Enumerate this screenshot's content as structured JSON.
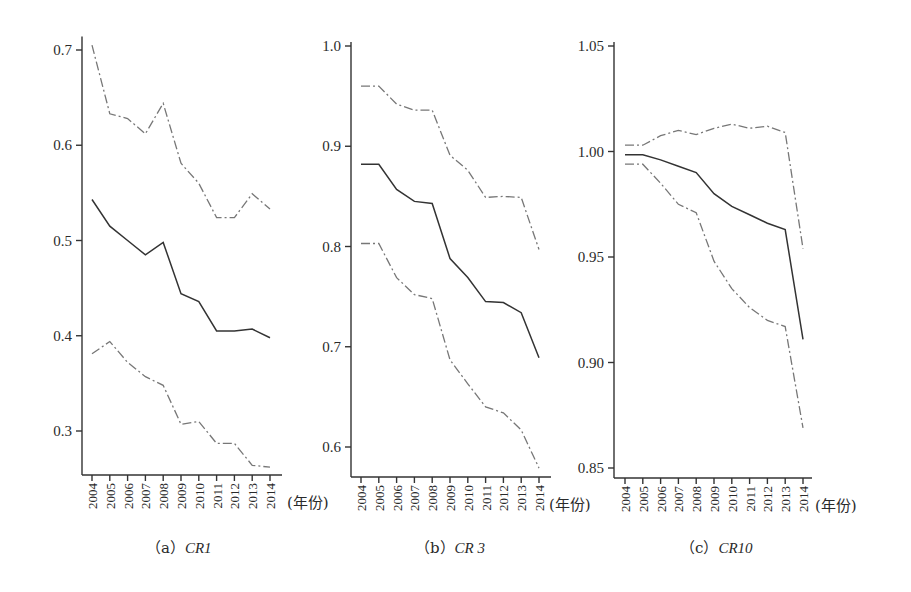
{
  "chart_data": [
    {
      "type": "line",
      "panel": "a",
      "caption_prefix": "（a）",
      "caption_metric": "CR1",
      "x": [
        "2004",
        "2005",
        "2006",
        "2007",
        "2008",
        "2009",
        "2010",
        "2011",
        "2012",
        "2013",
        "2014"
      ],
      "x_unit_label": "(年份)",
      "ylim": [
        0.255,
        0.71
      ],
      "yticks": [
        0.3,
        0.4,
        0.5,
        0.6,
        0.7
      ],
      "ytick_labels": [
        "0.3",
        "0.4",
        "0.5",
        "0.6",
        "0.7"
      ],
      "series": [
        {
          "name": "upper",
          "style": "dash-dot",
          "values": [
            0.705,
            0.633,
            0.628,
            0.612,
            0.644,
            0.581,
            0.56,
            0.524,
            0.524,
            0.549,
            0.533
          ]
        },
        {
          "name": "estimate",
          "style": "solid",
          "values": [
            0.543,
            0.515,
            0.5,
            0.485,
            0.498,
            0.444,
            0.436,
            0.405,
            0.405,
            0.407,
            0.398
          ]
        },
        {
          "name": "lower",
          "style": "dash-dot",
          "values": [
            0.381,
            0.394,
            0.372,
            0.357,
            0.348,
            0.307,
            0.31,
            0.287,
            0.287,
            0.264,
            0.262
          ]
        }
      ]
    },
    {
      "type": "line",
      "panel": "b",
      "caption_prefix": "（b）",
      "caption_metric": "CR 3",
      "x": [
        "2004",
        "2005",
        "2006",
        "2007",
        "2008",
        "2009",
        "2010",
        "2011",
        "2012",
        "2013",
        "2014"
      ],
      "x_unit_label": "(年份)",
      "ylim": [
        0.57,
        1.0
      ],
      "yticks": [
        0.6,
        0.7,
        0.8,
        0.9,
        1.0
      ],
      "ytick_labels": [
        "0.6",
        "0.7",
        "0.8",
        "0.9",
        "1.0"
      ],
      "series": [
        {
          "name": "upper",
          "style": "dash-dot",
          "values": [
            0.96,
            0.96,
            0.942,
            0.936,
            0.936,
            0.891,
            0.876,
            0.849,
            0.85,
            0.849,
            0.797
          ]
        },
        {
          "name": "estimate",
          "style": "solid",
          "values": [
            0.882,
            0.882,
            0.857,
            0.845,
            0.843,
            0.788,
            0.769,
            0.745,
            0.744,
            0.734,
            0.689
          ]
        },
        {
          "name": "lower",
          "style": "dash-dot",
          "values": [
            0.803,
            0.803,
            0.769,
            0.752,
            0.748,
            0.687,
            0.663,
            0.64,
            0.634,
            0.617,
            0.579
          ]
        }
      ]
    },
    {
      "type": "line",
      "panel": "c",
      "caption_prefix": "（c）",
      "caption_metric": "CR10",
      "x": [
        "2004",
        "2005",
        "2006",
        "2007",
        "2008",
        "2009",
        "2010",
        "2011",
        "2012",
        "2013",
        "2014"
      ],
      "x_unit_label": "(年份)",
      "ylim": [
        0.845,
        1.05
      ],
      "yticks": [
        0.85,
        0.9,
        0.95,
        1.0,
        1.05
      ],
      "ytick_labels": [
        "0.85",
        "0.90",
        "0.95",
        "1.00",
        "1.05"
      ],
      "series": [
        {
          "name": "upper",
          "style": "dash-dot",
          "values": [
            1.003,
            1.003,
            1.0075,
            1.01,
            1.008,
            1.011,
            1.013,
            1.011,
            1.012,
            1.009,
            0.954
          ]
        },
        {
          "name": "estimate",
          "style": "solid",
          "values": [
            0.9985,
            0.9985,
            0.996,
            0.993,
            0.99,
            0.98,
            0.974,
            0.97,
            0.966,
            0.963,
            0.911
          ]
        },
        {
          "name": "lower",
          "style": "dash-dot",
          "values": [
            0.994,
            0.994,
            0.985,
            0.975,
            0.971,
            0.948,
            0.935,
            0.926,
            0.92,
            0.917,
            0.869
          ]
        }
      ]
    }
  ]
}
